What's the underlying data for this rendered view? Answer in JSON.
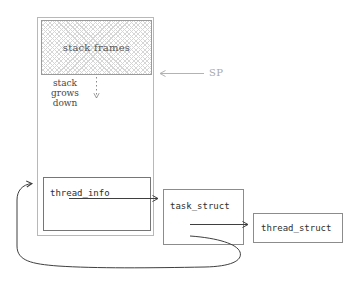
{
  "diagram": {
    "title_hint": "kernel stack / thread structures diagram",
    "labels": {
      "stack_frames": "stack frames",
      "grows_line1": "stack grows",
      "grows_line2": "down",
      "sp": "SP",
      "thread_info": "thread_info",
      "task_struct": "task_struct",
      "thread_struct": "thread_struct"
    },
    "connections": [
      {
        "from": "SP",
        "to": "bottom of stack frames",
        "style": "gray solid arrow pointing left"
      },
      {
        "from": "stack frames bottom",
        "to": "down",
        "style": "gray dotted arrow (stack grows down)"
      },
      {
        "from": "thread_info",
        "to": "task_struct",
        "style": "dark solid arrow"
      },
      {
        "from": "task_struct",
        "to": "thread_struct",
        "style": "dark solid arrow"
      },
      {
        "from": "task_struct",
        "to": "thread_info",
        "style": "dark curved loop arrow around bottom-left"
      }
    ],
    "colors": {
      "background": "#ffffff",
      "outer_stack_border": "#b8b8b8",
      "hatch_box_border": "#9a9a9a",
      "hatch_line": "#d6d6d6",
      "struct_box_border": "#8c8c8c",
      "thread_info_border": "#767676",
      "arrow_dark": "#3f3f3f",
      "arrow_gray": "#b3b3b3",
      "dotted_arrow_gray": "#8a8a8a",
      "text_dark": "#2e2e2e",
      "text_serif": "#474747",
      "sp_text_gray": "#a8a8a8"
    }
  }
}
